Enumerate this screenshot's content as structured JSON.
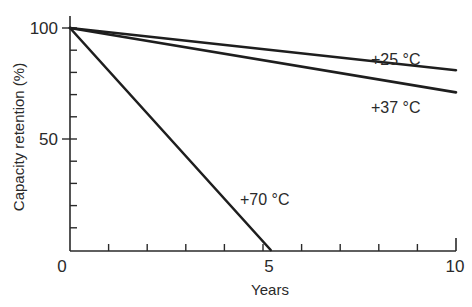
{
  "chart_data": {
    "type": "line",
    "title": "",
    "xlabel": "Years",
    "ylabel": "Capacity retention (%)",
    "xlim": [
      0,
      10
    ],
    "ylim": [
      0,
      100
    ],
    "grid": false,
    "legend": "inline labels",
    "x_ticks": [
      0,
      1,
      2,
      3,
      4,
      5,
      6,
      7,
      8,
      9,
      10
    ],
    "x_tick_labels": [
      {
        "value": 0,
        "label": "0"
      },
      {
        "value": 5,
        "label": "5"
      },
      {
        "value": 10,
        "label": "10"
      }
    ],
    "y_ticks": [
      10,
      20,
      30,
      40,
      50,
      60,
      70,
      80,
      90,
      100
    ],
    "y_tick_labels": [
      {
        "value": 50,
        "label": "50"
      },
      {
        "value": 100,
        "label": "100"
      }
    ],
    "series": [
      {
        "name": "+25 °C",
        "x": [
          0,
          10
        ],
        "values": [
          100,
          81
        ]
      },
      {
        "name": "+37 °C",
        "x": [
          0,
          10
        ],
        "values": [
          100,
          71
        ]
      },
      {
        "name": "+70 °C",
        "x": [
          0,
          5.2
        ],
        "values": [
          100,
          0
        ]
      }
    ]
  },
  "labels": {
    "s25": "+25 °C",
    "s37": "+37 °C",
    "s70": "+70 °C",
    "x0": "0",
    "x5": "5",
    "x10": "10",
    "y50": "50",
    "y100": "100",
    "xtitle": "Years",
    "ytitle": "Capacity retention (%)"
  }
}
